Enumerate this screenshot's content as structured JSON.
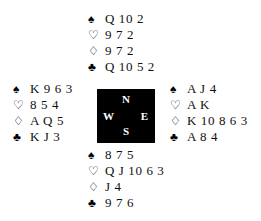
{
  "diagram": {
    "type": "bridge-hand-deal",
    "suit_symbols": {
      "spades": "♠",
      "hearts": "♡",
      "diamonds": "♢",
      "clubs": "♣"
    },
    "compass": {
      "north": "N",
      "south": "S",
      "west": "W",
      "east": "E"
    },
    "hands": {
      "north": {
        "spades": "Q 10 2",
        "hearts": "9 7 2",
        "diamonds": "9 7 2",
        "clubs": "Q 10 5 2"
      },
      "west": {
        "spades": "K 9 6 3",
        "hearts": "8 5 4",
        "diamonds": "A Q 5",
        "clubs": "K J 3"
      },
      "east": {
        "spades": "A J 4",
        "hearts": "A K",
        "diamonds": "K 10 8 6 3",
        "clubs": "A 8 4"
      },
      "south": {
        "spades": "8 7 5",
        "hearts": "Q J 10 6 3",
        "diamonds": "J 4",
        "clubs": "9 7 6"
      }
    },
    "colors": {
      "background": "#ffffff",
      "ink": "#111111",
      "compass_box": "#000000",
      "compass_text": "#ffffff"
    }
  }
}
